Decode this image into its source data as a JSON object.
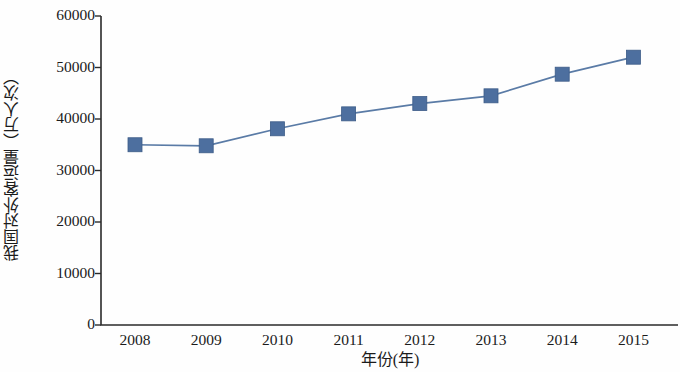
{
  "chart_data": {
    "type": "line",
    "title": "",
    "subtitle": "",
    "xlabel": "年份(年)",
    "ylabel": "我国对外客运量（万人次）",
    "categories": [
      "2008",
      "2009",
      "2010",
      "2011",
      "2012",
      "2013",
      "2014",
      "2015"
    ],
    "x": [
      2008,
      2009,
      2010,
      2011,
      2012,
      2013,
      2014,
      2015
    ],
    "values": [
      35000,
      34800,
      38100,
      41000,
      43000,
      44500,
      48700,
      52000
    ],
    "series": [
      {
        "name": "我国对外客运量",
        "values": [
          35000,
          34800,
          38100,
          41000,
          43000,
          44500,
          48700,
          52000
        ],
        "marker": "square",
        "marker_color": "#4d6f9f",
        "line_color": "#5a7ba6"
      }
    ],
    "ylim": [
      0,
      60000
    ],
    "yticks": [
      0,
      10000,
      20000,
      30000,
      40000,
      50000,
      60000
    ],
    "ytick_labels": [
      "0",
      "10000",
      "20000",
      "30000",
      "40000",
      "50000",
      "60000"
    ],
    "xtick_labels": [
      "2008",
      "2009",
      "2010",
      "2011",
      "2012",
      "2013",
      "2014",
      "2015"
    ],
    "grid": false,
    "legend": false,
    "legend_position": "none",
    "annotations": []
  },
  "axis": {
    "y_title": "我国对外客运量（万人次）",
    "x_title": "年份(年)"
  },
  "colors": {
    "marker": "#4d6f9f",
    "line": "#5a7ba6",
    "axis": "#2b2b2b",
    "background": "#fefefe",
    "text": "#1b1b1b"
  }
}
